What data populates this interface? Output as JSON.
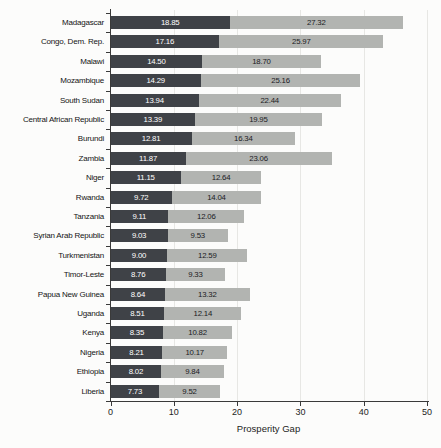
{
  "chart_data": {
    "type": "bar",
    "orientation": "horizontal",
    "stacked": true,
    "title": "",
    "xlabel": "Prosperity Gap",
    "ylabel": "",
    "xlim": [
      0,
      50
    ],
    "xticks": [
      0,
      10,
      20,
      30,
      40,
      50
    ],
    "grid": "vertical-light",
    "legend_position": "none",
    "categories": [
      "Madagascar",
      "Congo, Dem. Rep.",
      "Malawi",
      "Mozambique",
      "South Sudan",
      "Central African Republic",
      "Burundi",
      "Zambia",
      "Niger",
      "Rwanda",
      "Tanzania",
      "Syrian Arab Republic",
      "Turkmenistan",
      "Timor-Leste",
      "Papua New Guinea",
      "Uganda",
      "Kenya",
      "Nigeria",
      "Ethiopia",
      "Liberia"
    ],
    "series": [
      {
        "name": "series-1",
        "color": "#3f4247",
        "label_color": "#ffffff",
        "values": [
          18.85,
          17.16,
          14.5,
          14.29,
          13.94,
          13.39,
          12.81,
          11.87,
          11.15,
          9.72,
          9.11,
          9.03,
          9.0,
          8.76,
          8.64,
          8.51,
          8.35,
          8.21,
          8.02,
          7.73
        ]
      },
      {
        "name": "series-2",
        "color": "#b2b4b1",
        "label_color": "#202024",
        "values": [
          27.32,
          25.97,
          18.7,
          25.16,
          22.44,
          19.95,
          16.34,
          23.06,
          12.64,
          14.04,
          12.06,
          9.53,
          12.59,
          9.33,
          13.32,
          12.14,
          10.82,
          10.17,
          9.84,
          9.52
        ]
      }
    ]
  }
}
